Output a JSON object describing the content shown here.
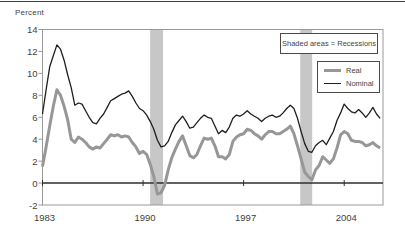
{
  "figure": {
    "y_axis_title": "Percent",
    "legend_note": "Shaded areas = Recessions",
    "legend": {
      "real_label": "Real",
      "nominal_label": "Nominal"
    }
  },
  "colors": {
    "real_line": "#979797",
    "nominal_line": "#1f1f1f",
    "recession_band": "#c7c7c7",
    "frame": "#999999",
    "zero_line": "#2e2e2e",
    "text": "#3f3f3f",
    "top_rule": "#3c3c3c"
  },
  "chart_data": {
    "type": "line",
    "title": "",
    "xlabel": "",
    "ylabel": "Percent",
    "x_start": 1983.0,
    "x_step": 0.25,
    "xlim": [
      1983,
      2006.7
    ],
    "ylim": [
      -2,
      14
    ],
    "x_ticks": [
      1983,
      1990,
      1997,
      2004
    ],
    "x_tick_labels": [
      "1983",
      "1990",
      "1997",
      "2004"
    ],
    "y_ticks": [
      14,
      12,
      10,
      8,
      6,
      4,
      2,
      0,
      -2
    ],
    "y_tick_labels": [
      "14",
      "12",
      "10",
      "8",
      "6",
      "4",
      "2",
      "0",
      "-2"
    ],
    "grid": false,
    "legend_position": "upper-right",
    "annotations": [
      "Shaded areas = Recessions"
    ],
    "recession_bands": [
      [
        1990.49,
        1991.39
      ],
      [
        2000.94,
        2001.77
      ]
    ],
    "series": [
      {
        "name": "Real",
        "values": [
          1.5,
          3.3,
          5.2,
          7.0,
          8.5,
          8.0,
          7.0,
          5.8,
          4.0,
          3.7,
          4.2,
          4.0,
          3.7,
          3.3,
          3.1,
          3.3,
          3.2,
          3.6,
          4.0,
          4.4,
          4.3,
          4.4,
          4.2,
          4.3,
          4.2,
          3.7,
          3.3,
          2.7,
          2.9,
          2.6,
          1.7,
          0.6,
          -1.0,
          -0.9,
          -0.2,
          1.2,
          2.3,
          3.1,
          3.8,
          4.3,
          3.4,
          2.5,
          2.3,
          2.6,
          3.4,
          4.1,
          4.0,
          4.1,
          3.4,
          2.4,
          2.4,
          2.2,
          2.6,
          3.8,
          4.2,
          4.4,
          4.5,
          4.9,
          4.8,
          4.5,
          4.3,
          4.0,
          4.4,
          4.7,
          4.7,
          4.5,
          4.5,
          4.7,
          4.9,
          5.2,
          4.5,
          3.4,
          2.2,
          1.0,
          0.6,
          0.3,
          1.2,
          1.6,
          2.4,
          2.1,
          1.8,
          2.2,
          3.2,
          4.4,
          4.7,
          4.5,
          3.9,
          3.8,
          3.8,
          3.7,
          3.4,
          3.5,
          3.7,
          3.4,
          3.2
        ]
      },
      {
        "name": "Nominal",
        "values": [
          6.3,
          8.5,
          10.6,
          11.6,
          12.6,
          12.2,
          11.2,
          9.9,
          8.7,
          7.1,
          7.3,
          7.2,
          6.6,
          6.0,
          5.5,
          5.4,
          5.9,
          6.3,
          6.9,
          7.5,
          7.7,
          7.9,
          8.1,
          8.2,
          8.4,
          7.9,
          7.3,
          6.8,
          6.6,
          6.2,
          5.6,
          4.9,
          3.9,
          3.3,
          3.4,
          3.8,
          4.6,
          5.3,
          5.7,
          6.1,
          5.6,
          5.0,
          5.1,
          5.5,
          5.9,
          6.2,
          6.0,
          5.9,
          5.2,
          4.5,
          4.8,
          4.6,
          5.1,
          5.9,
          6.2,
          6.1,
          6.3,
          6.6,
          6.3,
          6.1,
          5.9,
          5.6,
          5.9,
          6.1,
          6.2,
          6.0,
          6.1,
          6.4,
          6.8,
          7.1,
          6.8,
          5.9,
          4.7,
          3.6,
          2.9,
          2.8,
          3.4,
          3.7,
          3.9,
          3.5,
          4.1,
          4.7,
          5.7,
          6.4,
          7.2,
          6.8,
          6.5,
          6.4,
          6.7,
          6.4,
          6.0,
          6.4,
          6.9,
          6.3,
          5.9
        ]
      }
    ]
  }
}
